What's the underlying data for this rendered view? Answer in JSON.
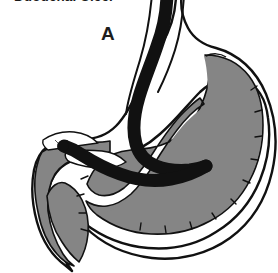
{
  "figure": {
    "title": "Duodenal Ulcer",
    "panel_label": "A",
    "width": 278,
    "height": 273,
    "background_color": "#ffffff",
    "type": "medical-illustration"
  },
  "colors": {
    "background": "#ffffff",
    "mucosa_fill": "#858585",
    "submucosa_fill": "#ffffff",
    "outline": "#111111",
    "tube": "#111111",
    "ulcer_crater": "#2a2a2a",
    "label_text": "#1d1d1d",
    "title_text": "#1a1a1a"
  },
  "parts": [
    {
      "id": "stomach-outer-wall",
      "name": "stomach-outer-wall",
      "description": "outer serosa outline of the stomach and duodenum"
    },
    {
      "id": "stomach-submucosa",
      "name": "stomach-submucosa-layer",
      "description": "white submucosal layer between outer wall and mucosa"
    },
    {
      "id": "stomach-mucosa",
      "name": "stomach-mucosa-lining",
      "description": "gray scalloped mucosal lining with rugae"
    },
    {
      "id": "duodenal-bulb",
      "name": "duodenal-bulb",
      "description": "duodenal bulb at lower left containing the ulcer"
    },
    {
      "id": "pyloric-antrum",
      "name": "pyloric-antrum",
      "description": "narrowed antrum and pylorus region"
    },
    {
      "id": "endoscope-tube",
      "name": "endoscope-tube",
      "description": "black tube entering through the esophagus, curving along the lesser curvature into the duodenum"
    },
    {
      "id": "ulcer-crater",
      "name": "ulcer-crater",
      "description": "small dark crater marking the duodenal ulcer"
    }
  ]
}
